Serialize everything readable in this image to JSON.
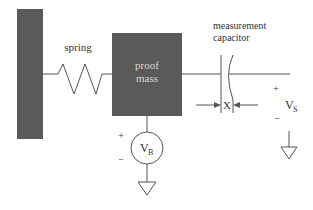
{
  "diagram": {
    "labels": {
      "spring": "spring",
      "proof_mass_line1": "proof",
      "proof_mass_line2": "mass",
      "capacitor_line1": "measurement",
      "capacitor_line2": "capacitor",
      "gap": "X",
      "vs_main": "V",
      "vs_sub": "S",
      "vb_main": "V",
      "vb_sub": "B",
      "vs_plus": "+",
      "vs_minus": "−",
      "vb_plus": "+",
      "vb_minus": "−"
    },
    "components": [
      "fixed-wall",
      "spring",
      "proof-mass",
      "measurement-capacitor",
      "bias-voltage-source",
      "sense-voltage",
      "ground-vb",
      "ground-vs"
    ],
    "colors": {
      "block_fill": "#5a5a5a",
      "line": "#555555",
      "text": "#333333",
      "block_text": "#d8d8d8"
    }
  }
}
